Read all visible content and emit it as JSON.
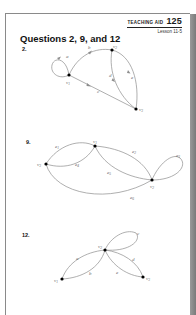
{
  "header": {
    "teaching_aid_label": "TEACHING AID",
    "teaching_aid_number": "125",
    "lesson": "Lesson 11-5"
  },
  "title": "Questions 2, 9, and 12",
  "questions": [
    {
      "number": "2.",
      "graph": {
        "vertices": [
          {
            "name": "v",
            "sub": "1"
          },
          {
            "name": "v",
            "sub": "2"
          },
          {
            "name": "v",
            "sub": "3"
          }
        ],
        "edges": [
          {
            "label": "a",
            "type": "loop",
            "at": "v1",
            "directed": true
          },
          {
            "label": "b",
            "from": "v1",
            "to": "v2",
            "directed": true
          },
          {
            "label": "c",
            "from": "v1",
            "to": "v3",
            "directed": true
          },
          {
            "label": "d",
            "from": "v2",
            "to": "v3",
            "directed": true
          },
          {
            "label": "e",
            "from": "v2",
            "to": "v3",
            "directed": true
          }
        ]
      }
    },
    {
      "number": "9.",
      "graph": {
        "vertices": [
          {
            "name": "v",
            "sub": "1"
          },
          {
            "name": "v",
            "sub": "2"
          },
          {
            "name": "v",
            "sub": "3"
          }
        ],
        "edges": [
          {
            "label": "e",
            "sub": "1",
            "from": "v3",
            "to": "v1"
          },
          {
            "label": "e",
            "sub": "2",
            "from": "v1",
            "to": "v2"
          },
          {
            "label": "e",
            "sub": "3",
            "type": "loop",
            "at": "v2"
          },
          {
            "label": "e",
            "sub": "4",
            "from": "v3",
            "to": "v1"
          },
          {
            "label": "e",
            "sub": "5",
            "from": "v1",
            "to": "v2"
          },
          {
            "label": "e",
            "sub": "6",
            "from": "v3",
            "to": "v2"
          }
        ]
      }
    },
    {
      "number": "12.",
      "graph": {
        "vertices": [
          {
            "name": "v",
            "sub": "1"
          },
          {
            "name": "v",
            "sub": "2"
          },
          {
            "name": "v",
            "sub": "3"
          }
        ],
        "edges": [
          {
            "label": "a",
            "from": "v1",
            "to": "v2"
          },
          {
            "label": "b",
            "from": "v1",
            "to": "v2"
          },
          {
            "label": "c",
            "type": "loop",
            "at": "v2"
          },
          {
            "label": "d",
            "from": "v2",
            "to": "v3"
          },
          {
            "label": "e",
            "from": "v2",
            "to": "v3"
          }
        ]
      }
    }
  ]
}
